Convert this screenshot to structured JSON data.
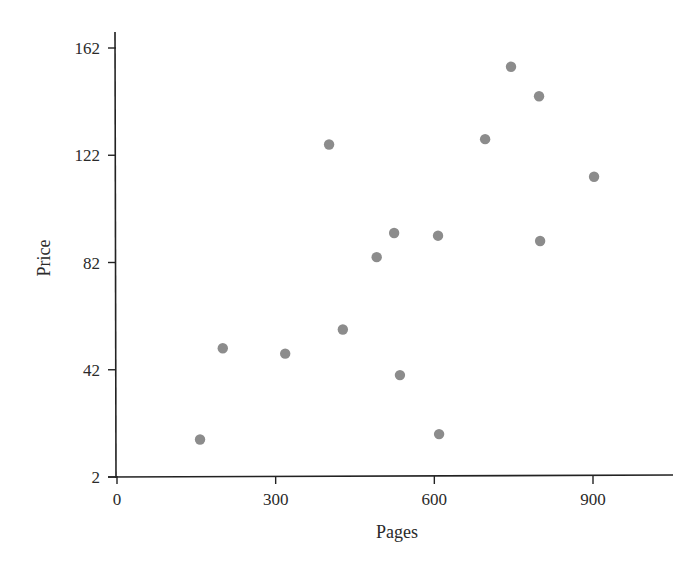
{
  "chart_data": {
    "type": "scatter",
    "title": "",
    "xlabel": "Pages",
    "ylabel": "Price",
    "xlim": [
      0,
      1050
    ],
    "ylim": [
      2,
      170
    ],
    "xticks": [
      0,
      300,
      600,
      900
    ],
    "yticks": [
      2,
      42,
      82,
      122,
      162
    ],
    "grid": false,
    "legend": null,
    "marker_color": "#8c8c8c",
    "series": [
      {
        "name": "books",
        "points": [
          {
            "x": 157,
            "y": 16
          },
          {
            "x": 200,
            "y": 50
          },
          {
            "x": 318,
            "y": 48
          },
          {
            "x": 401,
            "y": 126
          },
          {
            "x": 427,
            "y": 57
          },
          {
            "x": 491,
            "y": 84
          },
          {
            "x": 524,
            "y": 93
          },
          {
            "x": 535,
            "y": 40
          },
          {
            "x": 607,
            "y": 92
          },
          {
            "x": 609,
            "y": 18
          },
          {
            "x": 696,
            "y": 128
          },
          {
            "x": 745,
            "y": 155
          },
          {
            "x": 798,
            "y": 144
          },
          {
            "x": 800,
            "y": 90
          },
          {
            "x": 902,
            "y": 114
          }
        ]
      }
    ]
  },
  "labels": {
    "xlabel": "Pages",
    "ylabel": "Price"
  }
}
